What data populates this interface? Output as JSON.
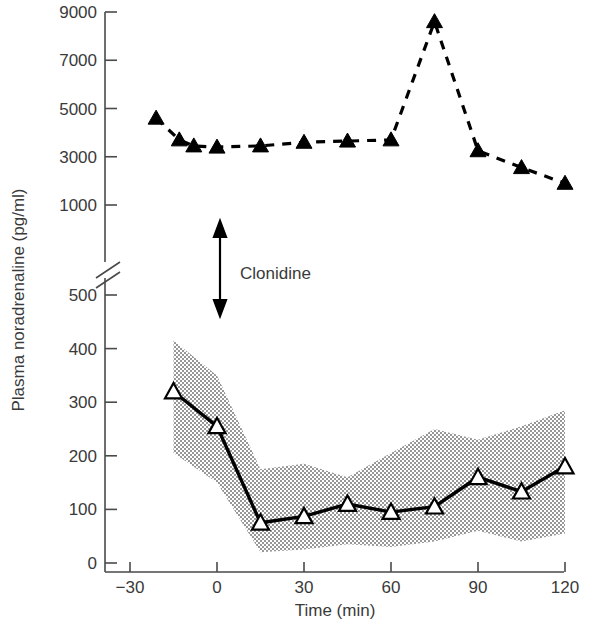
{
  "chart_data": {
    "type": "line",
    "title": "",
    "xlabel": "Time (min)",
    "ylabel": "Plasma noradrenaline (pg/ml)",
    "x_ticks": [
      -30,
      0,
      30,
      60,
      90,
      120
    ],
    "x_tick_labels": [
      "−30",
      "0",
      "30",
      "60",
      "90",
      "120"
    ],
    "xlim": [
      -30,
      120
    ],
    "y_axis_broken": true,
    "y_ticks_lower": [
      0,
      100,
      200,
      300,
      400,
      500
    ],
    "y_tick_labels_lower": [
      "0",
      "100",
      "200",
      "300",
      "400",
      "500"
    ],
    "y_ticks_upper": [
      1000,
      3000,
      5000,
      7000,
      9000
    ],
    "y_tick_labels_upper": [
      "1000",
      "3000",
      "5000",
      "7000",
      "9000"
    ],
    "grid": false,
    "legend_position": "none",
    "annotations": [
      {
        "label": "Clonidine",
        "kind": "double-headed-vertical-arrow",
        "x_min": 0
      }
    ],
    "series": [
      {
        "name": "Patient (phaeochromocytoma)",
        "marker": "filled-triangle",
        "line_style": "dashed",
        "axis": "upper",
        "x": [
          -21,
          -13,
          -8,
          0,
          15,
          30,
          45,
          60,
          75,
          90,
          105,
          120
        ],
        "values": [
          4600,
          3700,
          3450,
          3400,
          3450,
          3600,
          3650,
          3700,
          8600,
          3250,
          2550,
          1900
        ]
      },
      {
        "name": "Controls (mean ± SD)",
        "marker": "open-triangle",
        "line_style": "solid",
        "axis": "lower",
        "x": [
          -15,
          0,
          15,
          30,
          45,
          60,
          75,
          90,
          105,
          120
        ],
        "values": [
          320,
          255,
          75,
          87,
          110,
          95,
          105,
          160,
          133,
          180
        ],
        "band_upper": [
          415,
          350,
          175,
          185,
          160,
          205,
          250,
          230,
          255,
          285
        ],
        "band_lower": [
          205,
          150,
          20,
          25,
          35,
          30,
          40,
          60,
          40,
          55
        ]
      }
    ]
  },
  "axes": {
    "y_title": "Plasma noradrenaline (pg/ml)",
    "x_title": "Time (min)"
  },
  "annotation": {
    "clonidine_label": "Clonidine"
  }
}
